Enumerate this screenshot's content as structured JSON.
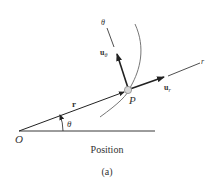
{
  "figure": {
    "caption_title": "Position",
    "caption_label": "(a)"
  },
  "labels": {
    "origin": "O",
    "point": "P",
    "radius_vector": "r",
    "angle": "θ",
    "r_axis": "r",
    "theta_axis": "θ",
    "unit_r_base": "u",
    "unit_r_sub": "r",
    "unit_theta_base": "u",
    "unit_theta_sub": "θ"
  },
  "colors": {
    "line": "#222222",
    "curve": "#666666",
    "point_fill": "#d8d8d8",
    "point_stroke": "#888888",
    "text": "#333333"
  }
}
